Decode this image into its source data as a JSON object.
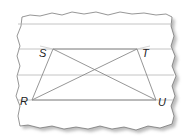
{
  "diagram": {
    "colors": {
      "background": "#ffffff",
      "paper": "#ffffff",
      "paper_edge": "#6a6a6a",
      "shadow": "#bcbcbc",
      "ruled_line": "#b5b5b5",
      "figure_line": "#8a8a8a",
      "label": "#222222"
    },
    "ruled_lines_y": [
      24,
      49,
      75,
      100
    ],
    "vertices": {
      "S": {
        "label": "S",
        "x": 53,
        "y": 49
      },
      "T": {
        "label": "T",
        "x": 137,
        "y": 49
      },
      "R": {
        "label": "R",
        "x": 32,
        "y": 100
      },
      "U": {
        "label": "U",
        "x": 156,
        "y": 100
      }
    },
    "segments": [
      [
        "S",
        "T"
      ],
      [
        "R",
        "U"
      ],
      [
        "R",
        "S"
      ],
      [
        "T",
        "U"
      ],
      [
        "R",
        "T"
      ],
      [
        "S",
        "U"
      ]
    ],
    "labels": {
      "S": "S",
      "T": "T",
      "R": "R",
      "U": "U"
    }
  }
}
